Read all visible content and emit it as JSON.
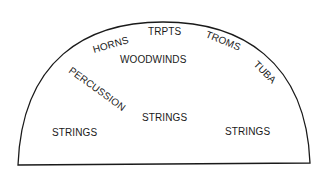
{
  "diagram": {
    "type": "orchestra-seating-chart",
    "shape": "semicircle",
    "stroke_color": "#1a1a1a",
    "background": "#ffffff",
    "labels": {
      "trumpets": "TRPTS",
      "horns": "HORNS",
      "trombones": "TROMS",
      "tuba": "TUBA",
      "woodwinds": "WOODWINDS",
      "percussion": "PERCUSSION",
      "strings_left": "STRINGS",
      "strings_center": "STRINGS",
      "strings_right": "STRINGS"
    }
  }
}
